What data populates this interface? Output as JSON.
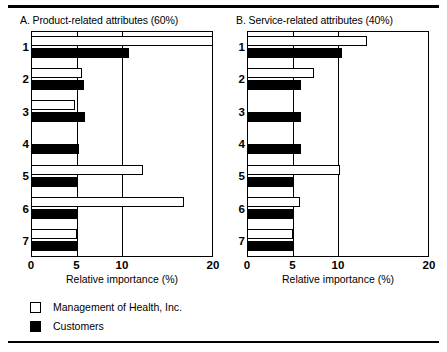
{
  "figure": {
    "top_rule": true,
    "bottom_rule": true
  },
  "legend": {
    "position": "bottom-left",
    "entries": [
      {
        "label": "Management of Health, Inc.",
        "style": "open",
        "color": "#ffffff",
        "swatch_name": "legend-swatch-open"
      },
      {
        "label": "Customers",
        "style": "solid",
        "color": "#000000",
        "swatch_name": "legend-swatch-solid"
      }
    ]
  },
  "chart_data": [
    {
      "type": "bar",
      "orientation": "horizontal",
      "panel": "A",
      "title": "A. Product-related attributes (60%)",
      "xlabel": "Relative importance (%)",
      "ylabel": "",
      "xlim": [
        0,
        20
      ],
      "xticks": [
        0,
        5,
        10,
        20
      ],
      "xtick_labels": [
        "0",
        "5",
        "10",
        "20"
      ],
      "grid": true,
      "categories": [
        "1",
        "2",
        "3",
        "4",
        "5",
        "6",
        "7"
      ],
      "series": [
        {
          "name": "Management of Health, Inc.",
          "style": "open",
          "values": [
            20.0,
            5.6,
            4.8,
            0.0,
            12.3,
            16.8,
            5.0
          ]
        },
        {
          "name": "Customers",
          "style": "solid",
          "values": [
            10.8,
            5.8,
            5.9,
            5.3,
            5.0,
            5.0,
            5.0
          ]
        }
      ]
    },
    {
      "type": "bar",
      "orientation": "horizontal",
      "panel": "B",
      "title": "B. Service-related attributes (40%)",
      "xlabel": "Relative importance (%)",
      "ylabel": "",
      "xlim": [
        0,
        20
      ],
      "xticks": [
        0,
        5,
        10,
        20
      ],
      "xtick_labels": [
        "0",
        "5",
        "10",
        "20"
      ],
      "grid": true,
      "categories": [
        "1",
        "2",
        "3",
        "4",
        "5",
        "6",
        "7"
      ],
      "series": [
        {
          "name": "Management of Health, Inc.",
          "style": "open",
          "values": [
            13.2,
            7.4,
            0.0,
            0.0,
            10.2,
            5.8,
            5.0
          ]
        },
        {
          "name": "Customers",
          "style": "solid",
          "values": [
            10.4,
            5.9,
            5.9,
            5.9,
            5.0,
            5.0,
            5.0
          ]
        }
      ]
    }
  ]
}
